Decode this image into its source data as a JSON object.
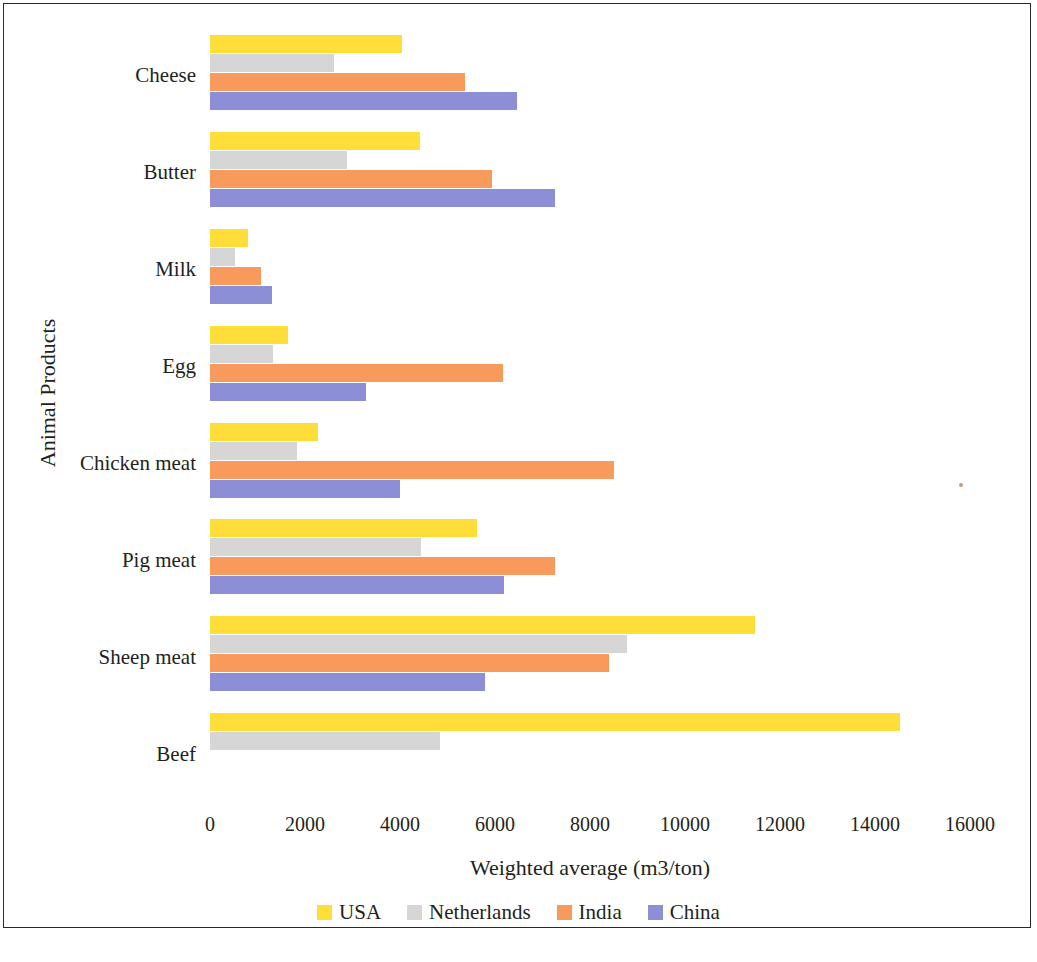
{
  "chart_data": {
    "type": "bar",
    "orientation": "horizontal",
    "title": "",
    "xlabel": "Weighted average (m3/ton)",
    "ylabel": "Animal Products",
    "xlim": [
      0,
      16000
    ],
    "xticks": [
      0,
      2000,
      4000,
      6000,
      8000,
      10000,
      12000,
      14000,
      16000
    ],
    "xtick_labels": [
      "0",
      "2000",
      "4000",
      "6000",
      "8000",
      "10000",
      "12000",
      "14000",
      "16000"
    ],
    "grid": false,
    "legend_position": "bottom",
    "categories": [
      "Cheese",
      "Butter",
      "Milk",
      "Egg",
      "Chicken meat",
      "Pig meat",
      "Sheep meat",
      "Beef"
    ],
    "series": [
      {
        "name": "USA",
        "color": "#FFDE3A",
        "values": [
          4040,
          4420,
          800,
          1640,
          2270,
          5620,
          11470,
          14530
        ]
      },
      {
        "name": "Netherlands",
        "color": "#D6D6D6",
        "values": [
          2620,
          2880,
          530,
          1330,
          1830,
          4440,
          8780,
          4840
        ]
      },
      {
        "name": "India",
        "color": "#F79A5B",
        "values": [
          5370,
          5930,
          1070,
          6170,
          8510,
          7260,
          8400,
          0
        ]
      },
      {
        "name": "China",
        "color": "#8C8FD6",
        "values": [
          6460,
          7260,
          1300,
          3290,
          4000,
          6190,
          5790,
          0
        ]
      }
    ]
  },
  "legend": {
    "items": [
      {
        "label": "USA",
        "color": "#FFDE3A"
      },
      {
        "label": "Netherlands",
        "color": "#D6D6D6"
      },
      {
        "label": "India",
        "color": "#F79A5B"
      },
      {
        "label": "China",
        "color": "#8C8FD6"
      }
    ]
  },
  "axes": {
    "x_title": "Weighted average (m3/ton)",
    "y_title": "Animal Products"
  }
}
